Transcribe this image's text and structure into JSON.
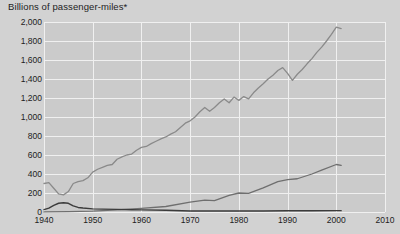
{
  "chart_data": {
    "type": "line",
    "title": "Billions of passenger-miles*",
    "xlabel": "",
    "ylabel": "Billions of passenger-miles*",
    "xlim": [
      1940,
      2010
    ],
    "ylim": [
      0,
      2000
    ],
    "grid": true,
    "legend": "none",
    "x_ticks": [
      "1940",
      "1950",
      "1960",
      "1970",
      "1980",
      "1990",
      "2000",
      "2010"
    ],
    "x_tick_values": [
      1940,
      1950,
      1960,
      1970,
      1980,
      1990,
      2000,
      2010
    ],
    "y_ticks": [
      "0",
      "200",
      "400",
      "600",
      "800",
      "1,000",
      "1,200",
      "1,400",
      "1,600",
      "1,800",
      "2,000"
    ],
    "y_tick_values": [
      0,
      200,
      400,
      600,
      800,
      1000,
      1200,
      1400,
      1600,
      1800,
      2000
    ],
    "series": [
      {
        "name": "automobile",
        "color": "#8a8a8a",
        "width": 1.3,
        "x": [
          1940,
          1941,
          1942,
          1943,
          1944,
          1945,
          1946,
          1947,
          1948,
          1949,
          1950,
          1951,
          1952,
          1953,
          1954,
          1955,
          1956,
          1957,
          1958,
          1959,
          1960,
          1961,
          1962,
          1963,
          1964,
          1965,
          1966,
          1967,
          1968,
          1969,
          1970,
          1971,
          1972,
          1973,
          1974,
          1975,
          1976,
          1977,
          1978,
          1979,
          1980,
          1981,
          1982,
          1983,
          1984,
          1985,
          1986,
          1987,
          1988,
          1989,
          1990,
          1991,
          1992,
          1993,
          1994,
          1995,
          1996,
          1997,
          1998,
          1999,
          2000,
          2001
        ],
        "values": [
          300,
          310,
          250,
          190,
          180,
          215,
          300,
          320,
          330,
          360,
          420,
          450,
          470,
          490,
          500,
          555,
          580,
          600,
          610,
          650,
          680,
          690,
          720,
          745,
          770,
          790,
          820,
          845,
          890,
          935,
          960,
          1000,
          1055,
          1100,
          1060,
          1100,
          1150,
          1190,
          1150,
          1210,
          1175,
          1215,
          1190,
          1255,
          1305,
          1350,
          1400,
          1440,
          1490,
          1520,
          1460,
          1385,
          1450,
          1500,
          1560,
          1615,
          1680,
          1735,
          1800,
          1870,
          1945,
          1930
        ]
      },
      {
        "name": "air",
        "color": "#6f6f6f",
        "width": 1.3,
        "x": [
          1940,
          1945,
          1950,
          1955,
          1960,
          1965,
          1970,
          1973,
          1975,
          1978,
          1980,
          1982,
          1985,
          1988,
          1990,
          1992,
          1995,
          1997,
          2000,
          2001
        ],
        "values": [
          1,
          4,
          10,
          22,
          38,
          58,
          105,
          125,
          120,
          175,
          200,
          195,
          255,
          320,
          340,
          350,
          400,
          440,
          500,
          490
        ]
      },
      {
        "name": "rail",
        "color": "#3b3b3b",
        "width": 1.4,
        "x": [
          1940,
          1941,
          1942,
          1943,
          1944,
          1945,
          1946,
          1947,
          1948,
          1950,
          1952,
          1955,
          1958,
          1960,
          1965,
          1970,
          1975,
          1980,
          1985,
          1990,
          1995,
          2000,
          2001
        ],
        "values": [
          25,
          40,
          70,
          92,
          97,
          92,
          65,
          48,
          42,
          33,
          30,
          28,
          23,
          22,
          18,
          11,
          10,
          11,
          11,
          13,
          13,
          14,
          14
        ]
      }
    ]
  }
}
